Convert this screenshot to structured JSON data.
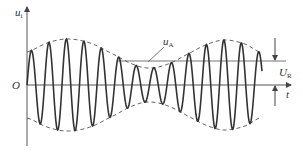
{
  "diagram": {
    "type": "amplitude-modulated waveform",
    "labels": {
      "y_axis": "u",
      "y_axis_sub": "i",
      "origin": "O",
      "x_axis": "t",
      "envelope": "u",
      "envelope_sub": "A",
      "reference": "U",
      "reference_sub": "R"
    },
    "colors": {
      "wave": "#333333",
      "axis": "#555555",
      "envelope": "#666666",
      "reference_line": "#777777"
    },
    "geometry": {
      "axis_x": 27,
      "baseline_y": 85,
      "axis_top_y": 6,
      "axis_bottom_y": 146,
      "t_axis_end_x": 291,
      "reference_y": 61,
      "reference_start_x": 118,
      "reference_end_x": 286,
      "wave_start_x": 27,
      "wave_end_x": 262,
      "carrier_period_px": 17.5,
      "envelope_points": [
        [
          27,
          52
        ],
        [
          47,
          43
        ],
        [
          67,
          39
        ],
        [
          90,
          43
        ],
        [
          115,
          55
        ],
        [
          135,
          65
        ],
        [
          150,
          68
        ],
        [
          168,
          64
        ],
        [
          190,
          53
        ],
        [
          208,
          44
        ],
        [
          225,
          40
        ],
        [
          245,
          44
        ],
        [
          262,
          53
        ]
      ],
      "ur_arrow_x": 275
    }
  }
}
